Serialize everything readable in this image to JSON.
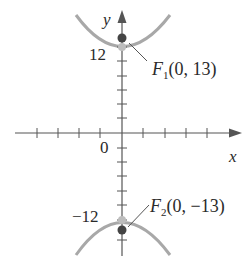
{
  "figure": {
    "axes": {
      "x_label": "x",
      "y_label": "y",
      "origin_label": "0",
      "y_tick_labels": {
        "top": "12",
        "bottom": "−12"
      }
    },
    "foci": [
      {
        "name": "F",
        "sub": "1",
        "coords": "(0, 13)"
      },
      {
        "name": "F",
        "sub": "2",
        "coords": "(0, −13)"
      }
    ],
    "colors": {
      "axis": "#555555",
      "curve": "#a8a8a8",
      "focus_dot": "#444444",
      "vertex_dot": "#bdbdbd",
      "text": "#2a2a2a"
    }
  }
}
